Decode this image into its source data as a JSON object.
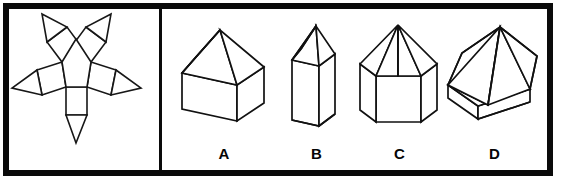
{
  "figure": {
    "kind": "spatial-reasoning-net-matching-question",
    "panels": {
      "left": {
        "name": "net-panel",
        "content_description": "unfolded net: central regular pentagon with five squares on its edges and a triangle on the outer edge of each square"
      },
      "right": {
        "name": "options-panel",
        "content_description": "four candidate 3D solids labelled A through D"
      }
    }
  },
  "net": {
    "name": "pentagonal-prism-pyramid-net",
    "center_polygon_sides": 5,
    "square_flaps": 5,
    "triangle_flaps": 5
  },
  "options": [
    {
      "id": "A",
      "label": "A",
      "name": "option-a",
      "shape_description": "rectangular box with square pyramid roof"
    },
    {
      "id": "B",
      "label": "B",
      "name": "option-b",
      "shape_description": "tall narrow prism with pointed pyramid top"
    },
    {
      "id": "C",
      "label": "C",
      "name": "option-c",
      "shape_description": "pentagonal prism topped by a pentagonal pyramid"
    },
    {
      "id": "D",
      "label": "D",
      "name": "option-d",
      "shape_description": "wide squat pyramid on a thin flat slab base"
    }
  ],
  "colors": {
    "frame": "#0a0a0a",
    "stroke": "#111111",
    "background": "#ffffff",
    "label_text": "#050505"
  }
}
